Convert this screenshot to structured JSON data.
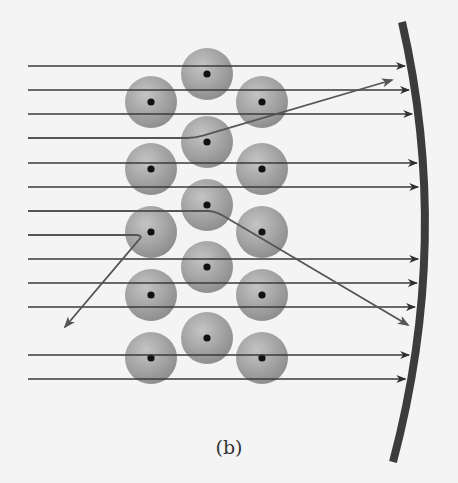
{
  "figure": {
    "caption": "(b)",
    "colors": {
      "background": "#f4f4f4",
      "line": "#3a3a3a",
      "deflected_line": "#555555",
      "atom_fill": "#a8a8a8",
      "nucleus": "#111111",
      "screen": "#3c3c3c"
    },
    "straight_rays_y": [
      66,
      90,
      114,
      163,
      187,
      259,
      283,
      307,
      355,
      379
    ],
    "deflected_rays": [
      {
        "start": [
          28,
          138
        ],
        "bend": [
          195,
          138
        ],
        "end": [
          392,
          80
        ]
      },
      {
        "start": [
          28,
          211
        ],
        "bend": [
          215,
          211
        ],
        "end": [
          408,
          325
        ]
      },
      {
        "start": [
          28,
          235
        ],
        "bend": [
          143,
          235
        ],
        "end": [
          65,
          327
        ]
      }
    ],
    "atoms": [
      {
        "x": 207,
        "y": 74
      },
      {
        "x": 151,
        "y": 102
      },
      {
        "x": 262,
        "y": 102
      },
      {
        "x": 207,
        "y": 142
      },
      {
        "x": 151,
        "y": 169
      },
      {
        "x": 262,
        "y": 169
      },
      {
        "x": 207,
        "y": 205
      },
      {
        "x": 151,
        "y": 232
      },
      {
        "x": 262,
        "y": 232
      },
      {
        "x": 207,
        "y": 267
      },
      {
        "x": 151,
        "y": 295
      },
      {
        "x": 262,
        "y": 295
      },
      {
        "x": 207,
        "y": 338
      },
      {
        "x": 151,
        "y": 358
      },
      {
        "x": 262,
        "y": 358
      }
    ]
  }
}
